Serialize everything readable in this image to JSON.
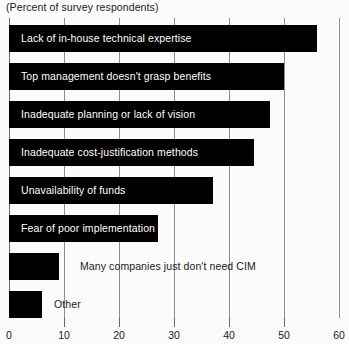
{
  "chart_data": {
    "type": "bar",
    "orientation": "horizontal",
    "title": "(Percent of survey respondents)",
    "xlabel": "",
    "ylabel": "",
    "xlim": [
      0,
      60
    ],
    "xticks": [
      0,
      10,
      20,
      30,
      40,
      50,
      60
    ],
    "xtick_labels": [
      "0",
      "10",
      "20",
      "30",
      "40",
      "50",
      "60"
    ],
    "grid": true,
    "legend": "none",
    "bar_color": "#000000",
    "background_color": "#fbfbfb",
    "categories": [
      "Lack of in-house technical expertise",
      "Top management doesn't grasp benefits",
      "Inadequate planning or lack of vision",
      "Inadequate cost-justification methods",
      "Unavailability of funds",
      "Fear of poor implementation",
      "Many companies just don't need CIM",
      "Other"
    ],
    "values": [
      56,
      50,
      47.5,
      44.5,
      37,
      27,
      9,
      6
    ],
    "label_placement": [
      "inside",
      "inside",
      "inside",
      "inside",
      "inside",
      "inside",
      "outside",
      "outside"
    ]
  },
  "axis": {
    "ticks": [
      {
        "value": "0"
      },
      {
        "value": "10"
      },
      {
        "value": "20"
      },
      {
        "value": "30"
      },
      {
        "value": "40"
      },
      {
        "value": "50"
      },
      {
        "value": "60"
      }
    ]
  },
  "bars": [
    {
      "label": "Lack of in-house technical expertise",
      "value": 56
    },
    {
      "label": "Top management doesn't grasp benefits",
      "value": 50
    },
    {
      "label": "Inadequate planning or lack of vision",
      "value": 47.5
    },
    {
      "label": "Inadequate cost-justification methods",
      "value": 44.5
    },
    {
      "label": "Unavailability of funds",
      "value": 37
    },
    {
      "label": "Fear of poor implementation",
      "value": 27
    },
    {
      "label": "Many companies just don't need CIM",
      "value": 9
    },
    {
      "label": "Other",
      "value": 6
    }
  ]
}
